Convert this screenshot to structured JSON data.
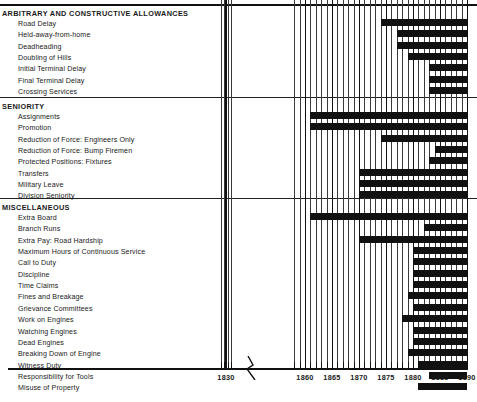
{
  "chart_data": {
    "type": "bar",
    "subtype": "horizontal-timeline-gantt",
    "title": "",
    "xlabel": "",
    "ylabel": "",
    "xlim": [
      1828,
      1891
    ],
    "axis_break": {
      "from": 1832,
      "to": 1858,
      "style": "zigzag"
    },
    "tick_labels": [
      "1830",
      "1860",
      "1865",
      "1870",
      "1875",
      "1880",
      "1885",
      "1890"
    ],
    "tick_values": [
      1830,
      1860,
      1865,
      1870,
      1875,
      1880,
      1885,
      1890
    ],
    "minor_tick_interval": 1,
    "grid": true,
    "legend": null,
    "bar_color": "#111111",
    "background": "#ffffff",
    "sections": [
      {
        "heading": "ARBITRARY AND CONSTRUCTIVE ALLOWANCES",
        "rows": [
          {
            "label": "Road Delay",
            "start": 1874,
            "end": 1890
          },
          {
            "label": "Held-away-from-home",
            "start": 1877,
            "end": 1890
          },
          {
            "label": "Deadheading",
            "start": 1877,
            "end": 1890
          },
          {
            "label": "Doubling of Hills",
            "start": 1879,
            "end": 1890
          },
          {
            "label": "Initial Terminal Delay",
            "start": 1883,
            "end": 1890
          },
          {
            "label": "Final Terminal Delay",
            "start": 1883,
            "end": 1890
          },
          {
            "label": "Crossing Services",
            "start": 1883,
            "end": 1890
          }
        ]
      },
      {
        "heading": "SENIORITY",
        "rows": [
          {
            "label": "Assignments",
            "start": 1861,
            "end": 1890
          },
          {
            "label": "Promotion",
            "start": 1861,
            "end": 1890
          },
          {
            "label": "Reduction of Force: Engineers Only",
            "start": 1874,
            "end": 1890
          },
          {
            "label": "Reduction of Force: Bump Firemen",
            "start": 1884,
            "end": 1890
          },
          {
            "label": "Protected Positions: Fixtures",
            "start": 1883,
            "end": 1890
          },
          {
            "label": "Transfers",
            "start": 1870,
            "end": 1890
          },
          {
            "label": "Military Leave",
            "start": 1870,
            "end": 1890
          },
          {
            "label": "Division Seniority",
            "start": 1870,
            "end": 1890
          }
        ]
      },
      {
        "heading": "MISCELLANEOUS",
        "rows": [
          {
            "label": "Extra Board",
            "start": 1861,
            "end": 1890
          },
          {
            "label": "Branch Runs",
            "start": 1882,
            "end": 1890
          },
          {
            "label": "Extra Pay: Road Hardship",
            "start": 1870,
            "end": 1890
          },
          {
            "label": "Maximum Hours of Continuous Service",
            "start": 1880,
            "end": 1890
          },
          {
            "label": "Call to Duty",
            "start": 1880,
            "end": 1890
          },
          {
            "label": "Discipline",
            "start": 1880,
            "end": 1890
          },
          {
            "label": "Time Claims",
            "start": 1880,
            "end": 1890
          },
          {
            "label": "Fines and Breakage",
            "start": 1879,
            "end": 1890
          },
          {
            "label": "Grievance Committees",
            "start": 1880,
            "end": 1890
          },
          {
            "label": "Work on Engines",
            "start": 1878,
            "end": 1890
          },
          {
            "label": "Watching Engines",
            "start": 1880,
            "end": 1890
          },
          {
            "label": "Dead Engines",
            "start": 1880,
            "end": 1890
          },
          {
            "label": "Breaking Down of Engine",
            "start": 1879,
            "end": 1890
          },
          {
            "label": "Witness Duty",
            "start": 1881,
            "end": 1890
          },
          {
            "label": "Responsibility for Tools",
            "start": 1883,
            "end": 1890
          },
          {
            "label": "Misuse of Property",
            "start": 1881,
            "end": 1890
          }
        ]
      }
    ]
  }
}
